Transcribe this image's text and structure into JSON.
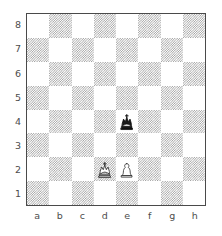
{
  "diagram": {
    "type": "chess-board-diagram",
    "orientation": "white-bottom",
    "board": {
      "files": [
        "a",
        "b",
        "c",
        "d",
        "e",
        "f",
        "g",
        "h"
      ],
      "ranks": [
        "8",
        "7",
        "6",
        "5",
        "4",
        "3",
        "2",
        "1"
      ],
      "light_square_color": "#ffffff",
      "dark_square_color": "#9d9d9d",
      "border_color": "#4a4a4a",
      "label_color": "#4d4d4d",
      "background_color": "#ffffff"
    },
    "position": {
      "fen": "8/8/8/8/4k3/8/3KP3/8",
      "pieces": [
        {
          "id": "black-king-e4",
          "piece": "king",
          "color": "black",
          "square": "e4",
          "file": 4,
          "rank": 4,
          "glyph": "♚"
        },
        {
          "id": "white-king-d2",
          "piece": "king",
          "color": "white",
          "square": "d2",
          "file": 3,
          "rank": 2,
          "glyph": "♔"
        },
        {
          "id": "white-pawn-e2",
          "piece": "pawn",
          "color": "white",
          "square": "e2",
          "file": 4,
          "rank": 2,
          "glyph": "♙"
        }
      ]
    }
  }
}
